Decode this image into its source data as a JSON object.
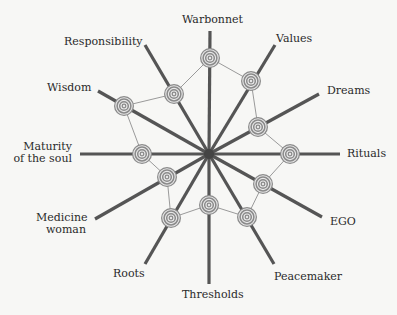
{
  "diagram": {
    "type": "radial-web",
    "center": [
      209,
      154
    ],
    "colors": {
      "spoke": "#555555",
      "node": "#8a8a8a",
      "link": "#9a9a9a",
      "text": "#2a2a2a",
      "background": "#f7f7f5"
    },
    "axes": [
      {
        "label": "Warbonnet",
        "end": [
          210,
          31
        ],
        "node": [
          210,
          58
        ]
      },
      {
        "label": "Values",
        "end": [
          275,
          45
        ],
        "node": [
          251,
          81
        ]
      },
      {
        "label": "Dreams",
        "end": [
          319,
          94
        ],
        "node": [
          258,
          127
        ]
      },
      {
        "label": "Rituals",
        "end": [
          340,
          154
        ],
        "node": [
          290,
          154
        ]
      },
      {
        "label": "EGO",
        "end": [
          322,
          217
        ],
        "node": [
          263,
          184
        ]
      },
      {
        "label": "Peacemaker",
        "end": [
          274,
          264
        ],
        "node": [
          247,
          217
        ]
      },
      {
        "label": "Thresholds",
        "end": [
          209,
          284
        ],
        "node": [
          209,
          205
        ]
      },
      {
        "label": "Roots",
        "end": [
          145,
          264
        ],
        "node": [
          171,
          218
        ]
      },
      {
        "label": "Medicine woman",
        "end": [
          95,
          219
        ],
        "node": [
          167,
          177
        ]
      },
      {
        "label": "Maturity of the soul",
        "end": [
          80,
          154
        ],
        "node": [
          142,
          154
        ]
      },
      {
        "label": "Wisdom",
        "end": [
          98,
          91
        ],
        "node": [
          124,
          106
        ]
      },
      {
        "label": "Responsibility",
        "end": [
          145,
          45
        ],
        "node": [
          174,
          94
        ]
      }
    ]
  },
  "labels": {
    "warbonnet": "Warbonnet",
    "values": "Values",
    "dreams": "Dreams",
    "rituals": "Rituals",
    "ego": "EGO",
    "peacemaker": "Peacemaker",
    "thresholds": "Thresholds",
    "roots": "Roots",
    "medicine_1": "Medicine",
    "medicine_2": "woman",
    "maturity_1": "Maturity",
    "maturity_2": "of the soul",
    "wisdom": "Wisdom",
    "responsibility": "Responsibility"
  }
}
